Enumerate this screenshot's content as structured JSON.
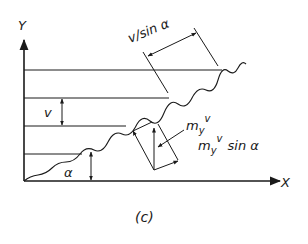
{
  "figure": {
    "caption": "(c)",
    "axes": {
      "x_label": "X",
      "y_label": "Y"
    },
    "labels": {
      "spacing": "v",
      "diagonal_spacing": "v/sin α",
      "angle": "α",
      "component_my_base": "m",
      "component_my_sub": "y",
      "component_my_var": "v",
      "component_sin_base": "m",
      "component_sin_sub": "y",
      "component_sin_var": "v",
      "component_sin_tail": "sin α"
    },
    "colors": {
      "ink": "#1a1a1a",
      "background": "#ffffff"
    }
  }
}
